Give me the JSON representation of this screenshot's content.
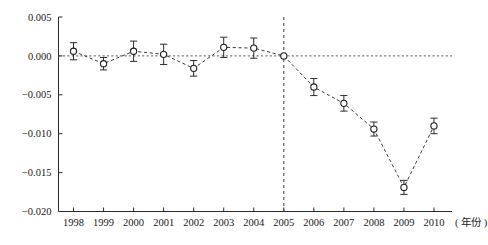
{
  "chart_data": {
    "type": "line",
    "title": "",
    "subtitle": "",
    "xlabel": "( 年份 )",
    "ylabel": "",
    "x": [
      1998,
      1999,
      2000,
      2001,
      2002,
      2003,
      2004,
      2005,
      2006,
      2007,
      2008,
      2009,
      2010
    ],
    "categories": [
      "1998",
      "1999",
      "2000",
      "2001",
      "2002",
      "2003",
      "2004",
      "2005",
      "2006",
      "2007",
      "2008",
      "2009",
      "2010"
    ],
    "values": [
      0.0006,
      -0.001,
      0.0006,
      0.0002,
      -0.0016,
      0.0011,
      0.001,
      0.0,
      -0.004,
      -0.0061,
      -0.0094,
      -0.0169,
      -0.009
    ],
    "errors": [
      0.0011,
      0.0008,
      0.0013,
      0.0013,
      0.001,
      0.0013,
      0.0013,
      0.0,
      0.0011,
      0.001,
      0.0009,
      0.0009,
      0.001
    ],
    "series": [
      {
        "name": "estimate",
        "values": [
          0.0006,
          -0.001,
          0.0006,
          0.0002,
          -0.0016,
          0.0011,
          0.001,
          0.0,
          -0.004,
          -0.0061,
          -0.0094,
          -0.0169,
          -0.009
        ],
        "errors": [
          0.0011,
          0.0008,
          0.0013,
          0.0013,
          0.001,
          0.0013,
          0.0013,
          0.0,
          0.0011,
          0.001,
          0.0009,
          0.0009,
          0.001
        ]
      }
    ],
    "ylim": [
      -0.02,
      0.005
    ],
    "yticks": [
      0.005,
      0.0,
      -0.005,
      -0.01,
      -0.015,
      -0.02
    ],
    "ytick_labels": [
      "0.005",
      "0.000",
      "-0.005",
      "-0.010",
      "-0.015",
      "-0.020"
    ],
    "xlim": [
      1997.5,
      2010.6
    ],
    "grid": false,
    "legend": null,
    "annotations": [
      {
        "name": "zero-reference-line",
        "type": "hline",
        "y": 0.0,
        "style": "dashed"
      },
      {
        "name": "event-year-line",
        "type": "vline",
        "x": 2005,
        "style": "dashed"
      }
    ],
    "marker_style": "open-circle",
    "line_style": "dashed",
    "colors": {
      "line": "#3a3a3a",
      "marker_fill": "#ffffff",
      "marker_stroke": "#1d1d1d",
      "axis": "#2b2b2b",
      "zero_line": "#5a5a5a",
      "event_line": "#3a3a3a",
      "background": "#ffffff"
    }
  }
}
